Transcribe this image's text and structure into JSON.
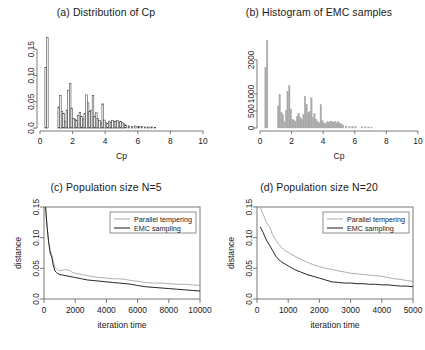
{
  "figure": {
    "background": "#ffffff",
    "panel_count": 4
  },
  "chart_data": [
    {
      "panel": "a",
      "type": "bar",
      "title": "(a) Distribution of Cp",
      "xlabel": "Cp",
      "ylabel": "",
      "xlim": [
        0,
        10
      ],
      "ylim": [
        0,
        0.175
      ],
      "xticks": [
        0,
        2,
        4,
        6,
        8,
        10
      ],
      "xtick_labels": [
        "0",
        "2",
        "4",
        "6",
        "8",
        "10"
      ],
      "yticks": [
        0.0,
        0.05,
        0.1,
        0.15
      ],
      "ytick_labels": [
        "0.0",
        "0.05",
        "0.10",
        "0.15"
      ],
      "grid": false,
      "legend": "none",
      "bar_style": "hollow-outline",
      "bar_color": "#3a3a3a",
      "bin_width": 0.1,
      "x": [
        0.35,
        0.45,
        1.15,
        1.25,
        1.35,
        1.45,
        1.55,
        1.65,
        1.75,
        1.85,
        1.95,
        2.05,
        2.15,
        2.25,
        2.35,
        2.45,
        2.55,
        2.65,
        2.75,
        2.85,
        2.95,
        3.05,
        3.15,
        3.25,
        3.35,
        3.45,
        3.55,
        3.65,
        3.75,
        3.85,
        3.95,
        4.05,
        4.15,
        4.25,
        4.35,
        4.45,
        4.55,
        4.65,
        4.75,
        4.85,
        4.95,
        5.05,
        5.15,
        5.25,
        5.45,
        5.65,
        5.85,
        6.05,
        6.25,
        6.45,
        6.65,
        6.85,
        7.05
      ],
      "values": [
        0.115,
        0.172,
        0.04,
        0.062,
        0.032,
        0.028,
        0.013,
        0.034,
        0.072,
        0.085,
        0.038,
        0.018,
        0.016,
        0.014,
        0.024,
        0.03,
        0.022,
        0.017,
        0.028,
        0.063,
        0.048,
        0.031,
        0.034,
        0.062,
        0.022,
        0.029,
        0.018,
        0.014,
        0.01,
        0.046,
        0.015,
        0.01,
        0.009,
        0.013,
        0.011,
        0.014,
        0.013,
        0.012,
        0.014,
        0.011,
        0.013,
        0.01,
        0.008,
        0.006,
        0.004,
        0.003,
        0.004,
        0.003,
        0.003,
        0.002,
        0.002,
        0.002,
        0.001
      ]
    },
    {
      "panel": "b",
      "type": "bar",
      "title": "(b) Histogram of EMC samples",
      "xlabel": "Cp",
      "ylabel": "",
      "xlim": [
        0,
        10
      ],
      "ylim": [
        0,
        2700
      ],
      "xticks": [
        0,
        2,
        4,
        6,
        8,
        10
      ],
      "xtick_labels": [
        "0",
        "2",
        "4",
        "6",
        "8",
        "10"
      ],
      "yticks": [
        0,
        500,
        1000,
        2000
      ],
      "ytick_labels": [
        "0",
        "500",
        "1000",
        "2000"
      ],
      "grid": false,
      "legend": "none",
      "bar_style": "filled",
      "bar_color": "#a8a8a8",
      "bin_width": 0.1,
      "x": [
        0.35,
        0.45,
        1.15,
        1.25,
        1.35,
        1.45,
        1.55,
        1.65,
        1.75,
        1.85,
        1.95,
        2.05,
        2.15,
        2.25,
        2.35,
        2.45,
        2.55,
        2.65,
        2.75,
        2.85,
        2.95,
        3.05,
        3.15,
        3.25,
        3.35,
        3.45,
        3.55,
        3.65,
        3.75,
        3.85,
        3.95,
        4.05,
        4.15,
        4.25,
        4.35,
        4.45,
        4.55,
        4.65,
        4.75,
        4.85,
        4.95,
        5.05,
        5.15,
        5.25,
        5.45,
        5.65,
        5.85,
        6.05,
        6.45,
        6.65,
        6.85,
        7.05
      ],
      "values": [
        1780,
        2580,
        650,
        990,
        460,
        400,
        190,
        520,
        1080,
        1250,
        560,
        260,
        230,
        200,
        340,
        430,
        320,
        250,
        400,
        930,
        700,
        450,
        490,
        890,
        320,
        420,
        260,
        200,
        150,
        680,
        220,
        150,
        130,
        190,
        160,
        200,
        190,
        175,
        200,
        160,
        190,
        145,
        120,
        90,
        60,
        45,
        55,
        45,
        40,
        35,
        30,
        20
      ]
    },
    {
      "panel": "c",
      "type": "line",
      "title": "(c) Population size N=5",
      "xlabel": "iteration time",
      "ylabel": "distance",
      "xlim": [
        0,
        10000
      ],
      "ylim": [
        0,
        0.15
      ],
      "xticks": [
        0,
        2000,
        4000,
        6000,
        8000,
        10000
      ],
      "xtick_labels": [
        "0",
        "2000",
        "4000",
        "6000",
        "8000",
        "10000"
      ],
      "yticks": [
        0.0,
        0.05,
        0.1,
        0.15
      ],
      "ytick_labels": [
        "0.0",
        "0.05",
        "0.10",
        "0.15"
      ],
      "grid": false,
      "legend": "upper right",
      "series": [
        {
          "name": "Parallel tempering",
          "color": "#a0a0a0",
          "x": [
            100,
            200,
            300,
            400,
            500,
            600,
            700,
            800,
            900,
            1000,
            1200,
            1400,
            1600,
            1800,
            2000,
            2400,
            2800,
            3200,
            3600,
            4000,
            4400,
            4800,
            5200,
            5600,
            6000,
            6500,
            7000,
            7500,
            8000,
            8500,
            9000,
            9500,
            10000
          ],
          "values": [
            0.15,
            0.118,
            0.093,
            0.078,
            0.072,
            0.06,
            0.052,
            0.049,
            0.047,
            0.046,
            0.047,
            0.048,
            0.047,
            0.044,
            0.042,
            0.04,
            0.038,
            0.036,
            0.035,
            0.034,
            0.033,
            0.033,
            0.032,
            0.03,
            0.029,
            0.027,
            0.026,
            0.026,
            0.025,
            0.024,
            0.024,
            0.023,
            0.022
          ]
        },
        {
          "name": "EMC sampling",
          "color": "#1a1a1a",
          "x": [
            100,
            200,
            300,
            400,
            500,
            600,
            700,
            800,
            900,
            1000,
            1200,
            1400,
            1600,
            1800,
            2000,
            2400,
            2800,
            3200,
            3600,
            4000,
            4400,
            4800,
            5200,
            5600,
            6000,
            6500,
            7000,
            7500,
            8000,
            8500,
            9000,
            9500,
            10000
          ],
          "values": [
            0.15,
            0.117,
            0.092,
            0.075,
            0.068,
            0.054,
            0.046,
            0.043,
            0.041,
            0.04,
            0.039,
            0.038,
            0.037,
            0.036,
            0.035,
            0.033,
            0.031,
            0.03,
            0.029,
            0.028,
            0.027,
            0.026,
            0.025,
            0.024,
            0.022,
            0.02,
            0.019,
            0.018,
            0.017,
            0.016,
            0.015,
            0.014,
            0.013
          ]
        }
      ]
    },
    {
      "panel": "d",
      "type": "line",
      "title": "(d) Population size N=20",
      "xlabel": "iteration time",
      "ylabel": "distance",
      "xlim": [
        0,
        5000
      ],
      "ylim": [
        0,
        0.15
      ],
      "xticks": [
        0,
        1000,
        2000,
        3000,
        4000,
        5000
      ],
      "xtick_labels": [
        "0",
        "1000",
        "2000",
        "3000",
        "4000",
        "5000"
      ],
      "yticks": [
        0.0,
        0.05,
        0.1,
        0.15
      ],
      "ytick_labels": [
        "0.0",
        "0.05",
        "0.10",
        "0.15"
      ],
      "grid": false,
      "legend": "upper right",
      "series": [
        {
          "name": "Parallel tempering",
          "color": "#a0a0a0",
          "x": [
            100,
            200,
            300,
            400,
            500,
            600,
            700,
            800,
            900,
            1000,
            1200,
            1400,
            1600,
            1800,
            2000,
            2200,
            2400,
            2600,
            2800,
            3000,
            3200,
            3400,
            3600,
            3800,
            4000,
            4200,
            4400,
            4600,
            4800,
            5000
          ],
          "values": [
            0.15,
            0.138,
            0.125,
            0.118,
            0.105,
            0.096,
            0.089,
            0.083,
            0.079,
            0.076,
            0.07,
            0.065,
            0.06,
            0.056,
            0.053,
            0.05,
            0.048,
            0.046,
            0.044,
            0.042,
            0.041,
            0.04,
            0.039,
            0.038,
            0.037,
            0.035,
            0.033,
            0.032,
            0.03,
            0.029
          ]
        },
        {
          "name": "EMC sampling",
          "color": "#1a1a1a",
          "x": [
            100,
            200,
            300,
            400,
            500,
            600,
            700,
            800,
            900,
            1000,
            1200,
            1400,
            1600,
            1800,
            2000,
            2200,
            2400,
            2600,
            2800,
            3000,
            3200,
            3400,
            3600,
            3800,
            4000,
            4200,
            4400,
            4600,
            4800,
            5000
          ],
          "values": [
            0.118,
            0.108,
            0.096,
            0.088,
            0.079,
            0.07,
            0.064,
            0.06,
            0.057,
            0.054,
            0.048,
            0.044,
            0.04,
            0.037,
            0.034,
            0.031,
            0.028,
            0.027,
            0.026,
            0.026,
            0.025,
            0.025,
            0.024,
            0.024,
            0.023,
            0.023,
            0.022,
            0.021,
            0.021,
            0.02
          ]
        }
      ]
    }
  ]
}
